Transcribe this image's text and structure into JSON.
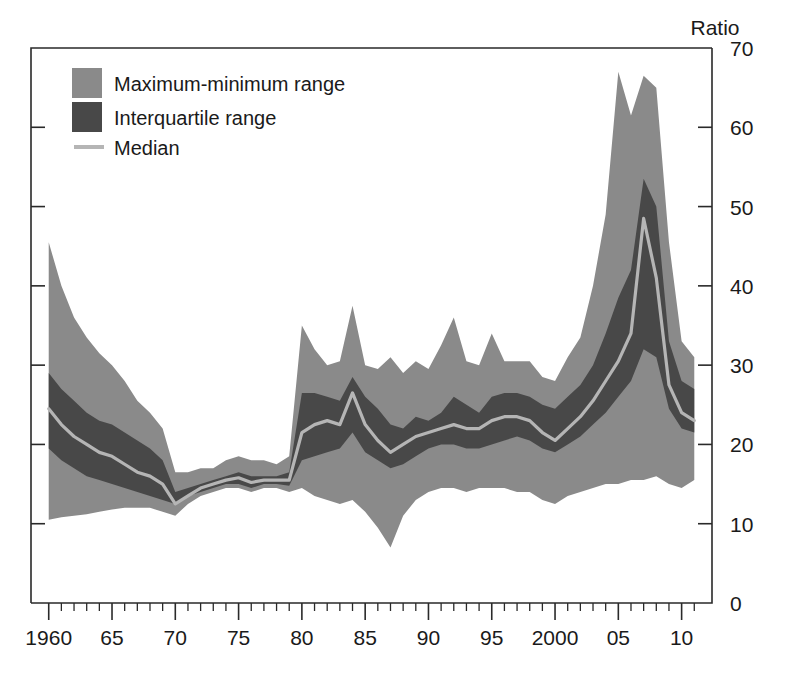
{
  "chart_data": {
    "type": "area",
    "title": "",
    "xlabel": "",
    "ylabel": "Ratio",
    "ylim": [
      0,
      70
    ],
    "xlim": [
      1958.5,
      1911.5
    ],
    "grid": false,
    "legend_position": "top-left",
    "y_ticks": [
      0,
      10,
      20,
      30,
      40,
      50,
      60,
      70
    ],
    "y_tick_labels": [
      "0",
      "10",
      "20",
      "30",
      "40",
      "50",
      "60",
      "70"
    ],
    "x_ticks": [
      1960,
      1965,
      1970,
      1975,
      1980,
      1985,
      1990,
      1995,
      2000,
      2005,
      2010
    ],
    "x_tick_labels": [
      "1960",
      "65",
      "70",
      "75",
      "80",
      "85",
      "90",
      "95",
      "2000",
      "05",
      "10"
    ],
    "x_minor_step": 1,
    "x": [
      1960,
      1961,
      1962,
      1963,
      1964,
      1965,
      1966,
      1967,
      1968,
      1969,
      1970,
      1971,
      1972,
      1973,
      1974,
      1975,
      1976,
      1977,
      1978,
      1979,
      1980,
      1981,
      1982,
      1983,
      1984,
      1985,
      1986,
      1987,
      1988,
      1989,
      1990,
      1991,
      1992,
      1993,
      1994,
      1995,
      1996,
      1997,
      1998,
      1999,
      2000,
      2001,
      2002,
      2003,
      2004,
      2005,
      2006,
      2007,
      2008,
      2009,
      2010,
      2011
    ],
    "series": [
      {
        "name": "Maximum-minimum range",
        "role": "band",
        "color": "#8a8a8a",
        "max": [
          45.5,
          40.0,
          36.0,
          33.5,
          31.5,
          30.0,
          28.0,
          25.5,
          24.0,
          22.0,
          16.5,
          16.5,
          17.0,
          17.0,
          18.0,
          18.5,
          18.0,
          18.0,
          17.5,
          18.5,
          35.0,
          32.0,
          30.0,
          30.5,
          37.5,
          30.0,
          29.5,
          31.0,
          29.0,
          30.5,
          29.5,
          32.5,
          36.0,
          30.5,
          30.0,
          34.0,
          30.5,
          30.5,
          30.5,
          28.5,
          28.0,
          31.0,
          33.5,
          40.0,
          49.0,
          67.0,
          61.5,
          66.5,
          65.0,
          45.5,
          33.0,
          31.0
        ],
        "min": [
          10.5,
          10.8,
          11.0,
          11.2,
          11.5,
          11.8,
          12.0,
          12.0,
          12.0,
          11.5,
          11.0,
          12.5,
          13.5,
          14.0,
          14.5,
          14.5,
          14.0,
          14.5,
          14.5,
          14.0,
          14.5,
          13.5,
          13.0,
          12.5,
          13.0,
          11.5,
          9.5,
          7.0,
          11.0,
          13.0,
          14.0,
          14.5,
          14.5,
          14.0,
          14.5,
          14.5,
          14.5,
          14.0,
          14.0,
          13.0,
          12.5,
          13.5,
          14.0,
          14.5,
          15.0,
          15.0,
          15.5,
          15.5,
          16.0,
          15.0,
          14.5,
          15.5
        ]
      },
      {
        "name": "Interquartile range",
        "role": "band",
        "color": "#484848",
        "q3": [
          29.0,
          27.0,
          25.5,
          24.0,
          23.0,
          22.5,
          21.5,
          20.5,
          19.5,
          18.0,
          14.0,
          14.5,
          15.0,
          15.5,
          16.0,
          16.5,
          16.0,
          16.0,
          16.0,
          16.5,
          26.5,
          26.5,
          26.0,
          25.5,
          28.5,
          26.0,
          24.5,
          22.5,
          22.0,
          23.5,
          23.0,
          24.0,
          26.0,
          25.0,
          24.0,
          26.0,
          26.5,
          26.5,
          26.0,
          25.0,
          24.5,
          26.0,
          27.5,
          30.0,
          34.0,
          38.5,
          42.0,
          53.5,
          50.0,
          33.0,
          28.0,
          27.0
        ],
        "q1": [
          19.5,
          18.0,
          17.0,
          16.0,
          15.5,
          15.0,
          14.5,
          14.0,
          13.5,
          13.0,
          12.5,
          13.5,
          14.0,
          14.5,
          15.0,
          15.0,
          14.5,
          15.0,
          15.0,
          14.8,
          18.0,
          18.5,
          19.0,
          19.5,
          21.5,
          19.0,
          18.0,
          17.0,
          17.5,
          18.5,
          19.5,
          20.0,
          20.0,
          19.5,
          19.5,
          20.0,
          20.5,
          21.0,
          20.5,
          19.5,
          19.0,
          20.0,
          21.0,
          22.5,
          24.0,
          26.0,
          28.0,
          32.0,
          31.0,
          24.5,
          22.0,
          21.5
        ]
      },
      {
        "name": "Median",
        "role": "line",
        "color": "#b5b5b5",
        "values": [
          24.5,
          22.5,
          21.0,
          20.0,
          19.0,
          18.5,
          17.5,
          16.5,
          16.0,
          15.0,
          12.5,
          13.5,
          14.5,
          15.0,
          15.5,
          15.8,
          15.2,
          15.5,
          15.5,
          15.5,
          21.5,
          22.5,
          23.0,
          22.5,
          26.5,
          22.5,
          20.5,
          19.0,
          20.0,
          21.0,
          21.5,
          22.0,
          22.5,
          22.0,
          22.0,
          23.0,
          23.5,
          23.5,
          23.0,
          21.5,
          20.5,
          22.0,
          23.5,
          25.5,
          28.0,
          30.5,
          34.0,
          48.5,
          41.0,
          27.5,
          24.0,
          23.0
        ]
      }
    ]
  },
  "legend": {
    "items": [
      {
        "label": "Maximum-minimum range",
        "swatch": "#8a8a8a",
        "type": "swatch"
      },
      {
        "label": "Interquartile range",
        "swatch": "#484848",
        "type": "swatch"
      },
      {
        "label": "Median",
        "swatch": "#b5b5b5",
        "type": "line"
      }
    ]
  },
  "axes": {
    "y_title": "Ratio"
  },
  "caption": {
    "text": ""
  }
}
